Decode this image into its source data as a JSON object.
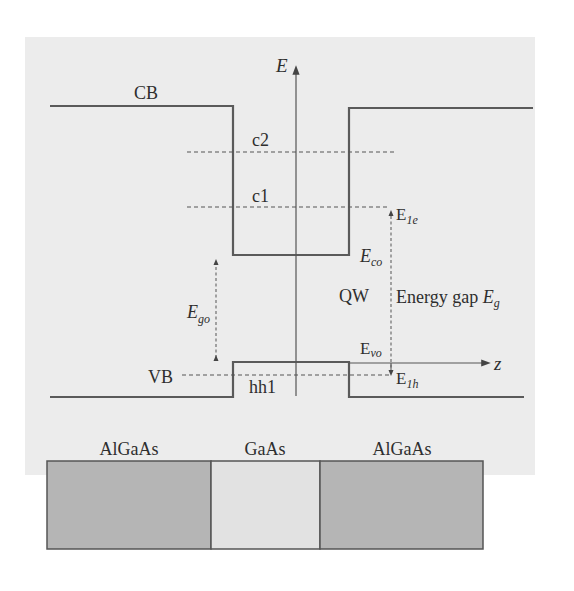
{
  "diagram": {
    "axes": {
      "energy_label": "E",
      "position_label": "z"
    },
    "bands": {
      "conduction": "CB",
      "valence": "VB",
      "well": "QW"
    },
    "levels": {
      "c2": "c2",
      "c1": "c1",
      "hh1": "hh1"
    },
    "energies": {
      "e1e_main": "E",
      "e1e_sub": "1e",
      "eco_main": "E",
      "eco_sub": "co",
      "ego_main": "E",
      "ego_sub": "go",
      "evo_main": "E",
      "evo_sub": "vo",
      "e1h_main": "E",
      "e1h_sub": "1h",
      "gap_text": "Energy gap ",
      "gap_main": "E",
      "gap_sub": "g"
    },
    "layers": [
      {
        "label": "AlGaAs",
        "color": "#b5b5b5"
      },
      {
        "label": "GaAs",
        "color": "#e2e2e2"
      },
      {
        "label": "AlGaAs",
        "color": "#b5b5b5"
      }
    ],
    "colors": {
      "line": "#5a5a5a",
      "background": "#ececec",
      "border": "#555555"
    }
  }
}
